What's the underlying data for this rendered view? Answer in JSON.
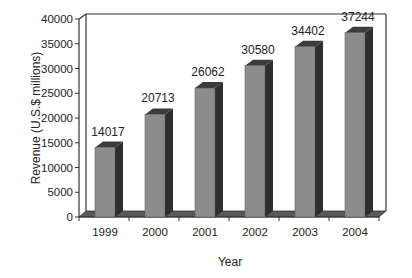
{
  "chart_data": {
    "type": "bar",
    "style": "3d",
    "title": "",
    "xlabel": "Year",
    "ylabel": "Revenue (U.S.$ millions)",
    "categories": [
      "1999",
      "2000",
      "2001",
      "2002",
      "2003",
      "2004"
    ],
    "values": [
      14017,
      20713,
      26062,
      30580,
      34402,
      37244
    ],
    "data_labels": [
      "14017",
      "20713",
      "26062",
      "30580",
      "34402",
      "37244"
    ],
    "ylim": [
      0,
      40000
    ],
    "yticks": [
      0,
      5000,
      10000,
      15000,
      20000,
      25000,
      30000,
      35000,
      40000
    ],
    "ytick_labels": [
      "0",
      "5000",
      "10000",
      "15000",
      "20000",
      "25000",
      "30000",
      "35000",
      "40000"
    ],
    "grid": false,
    "legend": null,
    "colors": {
      "bar_front": "#8c8c8c",
      "bar_side": "#2e2e2e",
      "bar_top": "#3c3c3c",
      "floor": "#5a5a5a",
      "axis": "#333333"
    }
  }
}
